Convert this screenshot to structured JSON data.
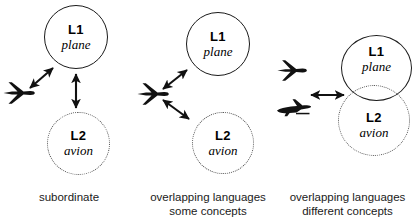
{
  "figure": {
    "type": "diagram",
    "background": "#ffffff",
    "ink_color": "#1a1a1a",
    "dotted_color": "#4a4a4a"
  },
  "panels": [
    {
      "id": "subordinate",
      "caption_lines": [
        "subordinate"
      ],
      "nodes": [
        {
          "lang": "L1",
          "word": "plane",
          "border": "solid"
        },
        {
          "lang": "L2",
          "word": "avion",
          "border": "dotted"
        }
      ],
      "concept_images": [
        {
          "name": "airplane-top-view-icon",
          "view": "top"
        }
      ],
      "links": [
        {
          "from": "airplane-top-view-icon",
          "to": "L1",
          "style": "double-headed-arrow"
        },
        {
          "from": "L1",
          "to": "L2",
          "style": "double-headed-arrow"
        }
      ]
    },
    {
      "id": "overlapping-some-concepts",
      "caption_lines": [
        "overlapping languages",
        "some concepts"
      ],
      "nodes": [
        {
          "lang": "L1",
          "word": "plane",
          "border": "solid"
        },
        {
          "lang": "L2",
          "word": "avion",
          "border": "dotted"
        }
      ],
      "concept_images": [
        {
          "name": "airplane-top-view-icon",
          "view": "top"
        }
      ],
      "links": [
        {
          "from": "airplane-top-view-icon",
          "to": "L1",
          "style": "double-headed-arrow"
        },
        {
          "from": "airplane-top-view-icon",
          "to": "L2",
          "style": "double-headed-arrow"
        }
      ]
    },
    {
      "id": "overlapping-different-concepts",
      "caption_lines": [
        "overlapping languages",
        "different concepts"
      ],
      "nodes": [
        {
          "lang": "L1",
          "word": "plane",
          "border": "solid"
        },
        {
          "lang": "L2",
          "word": "avion",
          "border": "dotted"
        }
      ],
      "concept_images": [
        {
          "name": "airplane-top-view-icon",
          "view": "top"
        },
        {
          "name": "airplane-side-view-icon",
          "view": "side"
        }
      ],
      "links": [
        {
          "from": "concept-images",
          "to": "circle-pair",
          "style": "double-headed-arrow"
        }
      ]
    }
  ]
}
